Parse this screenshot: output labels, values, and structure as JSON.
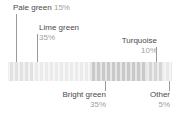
{
  "chart_data": {
    "type": "bar",
    "orientation": "horizontal-stacked",
    "title": "",
    "xlabel": "",
    "ylabel": "",
    "grid": false,
    "legend": "none",
    "total": 100,
    "categories": [
      "Pale green",
      "Lime green",
      "Bright green",
      "Turquoise",
      "Other"
    ],
    "values": [
      15,
      35,
      35,
      10,
      5
    ],
    "value_labels": [
      "15%",
      "35%",
      "35%",
      "10%",
      "5%"
    ],
    "colors": [
      "#e2e2e2",
      "#ebebeb",
      "#c9c9c9",
      "#d6d6d6",
      "#e8e8e8"
    ],
    "segments": [
      {
        "name": "Pale green",
        "value": 15,
        "pct_text": "15%",
        "color": "#e2e2e2",
        "label_side": "top",
        "label_align": "left"
      },
      {
        "name": "Lime green",
        "value": 35,
        "pct_text": "35%",
        "color": "#ebebeb",
        "label_side": "top",
        "label_align": "left"
      },
      {
        "name": "Bright green",
        "value": 35,
        "pct_text": "35%",
        "color": "#c9c9c9",
        "label_side": "bottom",
        "label_align": "right"
      },
      {
        "name": "Turquoise",
        "value": 10,
        "pct_text": "10%",
        "color": "#d6d6d6",
        "label_side": "top",
        "label_align": "right"
      },
      {
        "name": "Other",
        "value": 5,
        "pct_text": "5%",
        "color": "#e8e8e8",
        "label_side": "bottom",
        "label_align": "right"
      }
    ]
  },
  "labels": {
    "pale_green": {
      "name": "Pale green",
      "pct": "15%"
    },
    "lime_green": {
      "name": "Lime green",
      "pct": "35%"
    },
    "bright_green": {
      "name": "Bright green",
      "pct": "35%"
    },
    "turquoise": {
      "name": "Turquoise",
      "pct": "10%"
    },
    "other": {
      "name": "Other",
      "pct": "5%"
    }
  },
  "style": {
    "text_color": "#4a4a4a",
    "pct_color": "#a0a0a0",
    "leader_color": "#9a9a9a",
    "background": "#ffffff"
  }
}
